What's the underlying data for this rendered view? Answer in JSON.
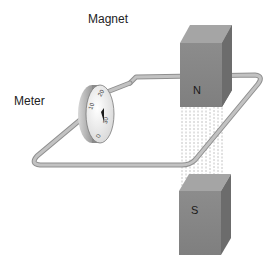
{
  "diagram": {
    "title_label": "Magnet",
    "meter_label": "Meter",
    "north_pole": "N",
    "south_pole": "S",
    "dial_ticks": [
      "0",
      "10",
      "20",
      "30"
    ],
    "colors": {
      "magnet_front": "#8a8a8a",
      "magnet_top": "#a8a8a8",
      "magnet_side": "#6e6e6e",
      "wire": "#b5b5b5",
      "wire_edge": "#8f8f8f",
      "field_lines": "#c4c4c4",
      "meter_body": "#9a9a9a",
      "meter_face": "#f0f0f0"
    }
  }
}
